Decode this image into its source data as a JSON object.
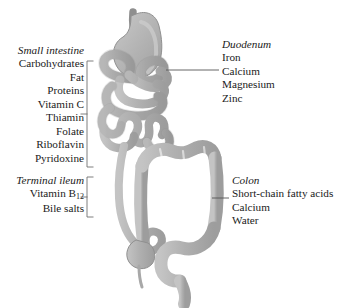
{
  "diagram": {
    "background_color": "#ffffff",
    "organ_fill_color": "#b3b3b3",
    "organ_stroke_color": "#8c8c8c",
    "highlight_color": "#d0d0d0",
    "text_color": "#1a1a1a",
    "line_color": "#555555"
  },
  "labels": {
    "small_intestine": {
      "title": "Small intestine",
      "items": [
        "Carbohydrates",
        "Fat",
        "Proteins",
        "Vitamin C",
        "Thiamin",
        "Folate",
        "Riboflavin",
        "Pyridoxine"
      ]
    },
    "terminal_ileum": {
      "title": "Terminal ileum",
      "items": [
        "Vitamin B12",
        "Bile salts"
      ],
      "vitamin_b_base": "Vitamin B",
      "vitamin_b_sub": "12"
    },
    "duodenum": {
      "title": "Duodenum",
      "items": [
        "Iron",
        "Calcium",
        "Magnesium",
        "Zinc"
      ]
    },
    "colon": {
      "title": "Colon",
      "items": [
        "Short-chain fatty acids",
        "Calcium",
        "Water"
      ]
    }
  },
  "anatomy_parts": [
    "esophagus",
    "stomach",
    "duodenum",
    "jejunum",
    "ileum",
    "terminal-ileum",
    "cecum",
    "appendix",
    "ascending-colon",
    "transverse-colon",
    "descending-colon",
    "sigmoid-colon",
    "rectum"
  ]
}
